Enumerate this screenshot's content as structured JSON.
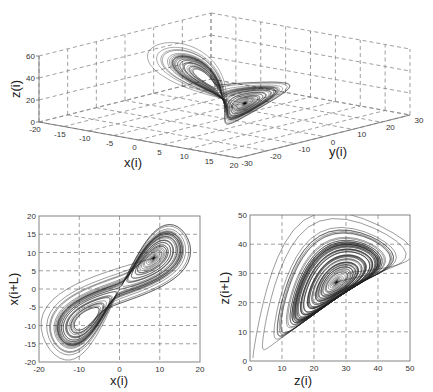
{
  "chart_data": [
    {
      "type": "line",
      "subtype": "3d-trajectory",
      "title": "",
      "description": "Lorenz attractor reconstructed in 3D phase space (two-lobe butterfly)",
      "xlabel": "x(i)",
      "ylabel": "y(i)",
      "zlabel": "z(i)",
      "xlim": [
        -20,
        20
      ],
      "ylim": [
        -30,
        30
      ],
      "zlim": [
        0,
        60
      ],
      "xticks": [
        "-20",
        "-15",
        "-10",
        "-5",
        "0",
        "5",
        "10",
        "15",
        "20"
      ],
      "yticks": [
        "-30",
        "-20",
        "-10",
        "0",
        "10",
        "20",
        "30"
      ],
      "zticks": [
        "0",
        "20",
        "40",
        "60"
      ],
      "grid": true,
      "lobes": [
        {
          "center_x": -8,
          "center_y": -8,
          "center_z": 27
        },
        {
          "center_x": 8,
          "center_y": 8,
          "center_z": 27
        }
      ]
    },
    {
      "type": "line",
      "subtype": "phase-portrait",
      "title": "",
      "xlabel": "x(i)",
      "ylabel": "x(i+L)",
      "xlim": [
        -20,
        20
      ],
      "ylim": [
        -20,
        20
      ],
      "xticks": [
        "-20",
        "-10",
        "0",
        "10",
        "20"
      ],
      "yticks": [
        "-20",
        "-15",
        "-10",
        "-5",
        "0",
        "5",
        "10",
        "15",
        "20"
      ],
      "grid": true,
      "lobes": [
        {
          "center": [
            -8.5,
            -8.5
          ],
          "x_range": [
            -17,
            -1
          ],
          "y_range": [
            -17,
            0
          ]
        },
        {
          "center": [
            9,
            9
          ],
          "x_range": [
            1,
            20
          ],
          "y_range": [
            -5,
            20
          ]
        }
      ]
    },
    {
      "type": "line",
      "subtype": "phase-portrait",
      "title": "",
      "xlabel": "z(i)",
      "ylabel": "z(i+L)",
      "xlim": [
        0,
        50
      ],
      "ylim": [
        0,
        50
      ],
      "xticks": [
        "0",
        "10",
        "20",
        "30",
        "40",
        "50"
      ],
      "yticks": [
        "0",
        "10",
        "20",
        "30",
        "40",
        "50"
      ],
      "grid": true,
      "spiral_center": [
        27,
        27
      ],
      "outer_envelope": {
        "x_range": [
          1,
          48
        ],
        "y_range": [
          1,
          48
        ]
      }
    }
  ],
  "labels": {
    "plot3d": {
      "x": "x(i)",
      "y": "y(i)",
      "z": "z(i)",
      "xticks": [
        "-20",
        "-15",
        "-10",
        "-5",
        "0",
        "5",
        "10",
        "15",
        "20"
      ],
      "yticks": [
        "-30",
        "-20",
        "-10",
        "0",
        "10",
        "20",
        "30"
      ],
      "zticks": [
        "0",
        "20",
        "40",
        "60"
      ]
    },
    "plotA": {
      "x": "x(i)",
      "y": "x(i+L)",
      "xticks": [
        "-20",
        "-10",
        "0",
        "10",
        "20"
      ],
      "yticks": [
        "-20",
        "-15",
        "-10",
        "-5",
        "0",
        "5",
        "10",
        "15",
        "20"
      ]
    },
    "plotB": {
      "x": "z(i)",
      "y": "z(i+L)",
      "xticks": [
        "0",
        "10",
        "20",
        "30",
        "40",
        "50"
      ],
      "yticks": [
        "0",
        "10",
        "20",
        "30",
        "40",
        "50"
      ]
    }
  }
}
